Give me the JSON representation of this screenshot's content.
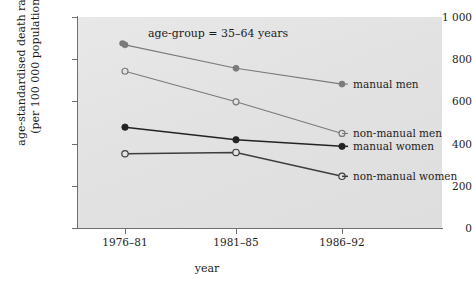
{
  "chart_data": {
    "type": "line",
    "title": "",
    "annotation": "age-group = 35–64 years",
    "xlabel": "year",
    "ylabel_line1": "age-standardised death rates",
    "ylabel_line2": "(per 100 000 population)",
    "categories": [
      "1976–81",
      "1981–85",
      "1986–92"
    ],
    "yticks": [
      "0",
      "200",
      "400",
      "600",
      "800",
      "1 000"
    ],
    "ytick_values": [
      0,
      200,
      400,
      600,
      800,
      1000
    ],
    "ylim": [
      0,
      1000
    ],
    "grid": false,
    "legend_position": "right-inline",
    "series": [
      {
        "name": "manual men",
        "values": [
          868,
          757,
          682
        ],
        "marker": "filled-circle",
        "color": "#7a7a7a",
        "label_color": "#1c1c1c"
      },
      {
        "name": "non-manual men",
        "values": [
          743,
          598,
          448
        ],
        "marker": "open-circle",
        "color": "#7a7a7a",
        "label_color": "#1c1c1c"
      },
      {
        "name": "manual women",
        "values": [
          478,
          418,
          387
        ],
        "marker": "filled-circle",
        "color": "#232323",
        "label_color": "#1c1c1c"
      },
      {
        "name": "non-manual women",
        "values": [
          352,
          358,
          245
        ],
        "marker": "open-circle",
        "color": "#3d3d3d",
        "label_color": "#1c1c1c"
      }
    ]
  },
  "colors": {
    "panel_background": "#e3e3e3",
    "axis": "#6f6f6f",
    "text": "#1c1c1c",
    "men_series": "#7a7a7a",
    "women_series": "#232323"
  }
}
